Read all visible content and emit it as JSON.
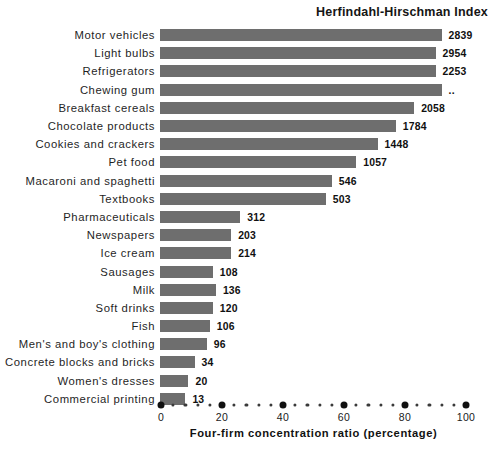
{
  "chart_data": {
    "type": "bar",
    "orientation": "horizontal",
    "title": "Herfindahl-Hirschman Index",
    "xlabel": "Four-firm concentration ratio (percentage)",
    "ylabel": "",
    "xlim": [
      0,
      100
    ],
    "xticks": [
      0,
      20,
      40,
      60,
      80,
      100
    ],
    "xtick_labels": [
      "0",
      "20",
      "40",
      "60",
      "80",
      "100"
    ],
    "minor_tick_step": 4,
    "grid": false,
    "legend": "none",
    "bar_color": "#6e6e6e",
    "value_label_header": "Herfindahl-Hirschman Index",
    "categories": [
      "Motor vehicles",
      "Light bulbs",
      "Refrigerators",
      "Chewing gum",
      "Breakfast cereals",
      "Chocolate products",
      "Cookies and crackers",
      "Pet food",
      "Macaroni and spaghetti",
      "Textbooks",
      "Pharmaceuticals",
      "Newspapers",
      "Ice cream",
      "Sausages",
      "Milk",
      "Soft drinks",
      "Fish",
      "Men's and boy's clothing",
      "Concrete blocks and bricks",
      "Women's dresses",
      "Commercial printing"
    ],
    "values": [
      92,
      90,
      90,
      92,
      83,
      77,
      71,
      64,
      56,
      54,
      26,
      23,
      23,
      17,
      18,
      17,
      16,
      15,
      11,
      9,
      8
    ],
    "value_unit": "percent",
    "hhi_labels": [
      "2839",
      "2954",
      "2253",
      "..",
      "2058",
      "1784",
      "1448",
      "1057",
      "546",
      "503",
      "312",
      "203",
      "214",
      "108",
      "136",
      "120",
      "106",
      "96",
      "34",
      "20",
      "13"
    ],
    "bars": [
      {
        "category": "Motor vehicles",
        "ratio": 92,
        "hhi": "2839"
      },
      {
        "category": "Light bulbs",
        "ratio": 90,
        "hhi": "2954"
      },
      {
        "category": "Refrigerators",
        "ratio": 90,
        "hhi": "2253"
      },
      {
        "category": "Chewing gum",
        "ratio": 92,
        "hhi": ".."
      },
      {
        "category": "Breakfast cereals",
        "ratio": 83,
        "hhi": "2058"
      },
      {
        "category": "Chocolate products",
        "ratio": 77,
        "hhi": "1784"
      },
      {
        "category": "Cookies and crackers",
        "ratio": 71,
        "hhi": "1448"
      },
      {
        "category": "Pet food",
        "ratio": 64,
        "hhi": "1057"
      },
      {
        "category": "Macaroni and spaghetti",
        "ratio": 56,
        "hhi": "546"
      },
      {
        "category": "Textbooks",
        "ratio": 54,
        "hhi": "503"
      },
      {
        "category": "Pharmaceuticals",
        "ratio": 26,
        "hhi": "312"
      },
      {
        "category": "Newspapers",
        "ratio": 23,
        "hhi": "203"
      },
      {
        "category": "Ice cream",
        "ratio": 23,
        "hhi": "214"
      },
      {
        "category": "Sausages",
        "ratio": 17,
        "hhi": "108"
      },
      {
        "category": "Milk",
        "ratio": 18,
        "hhi": "136"
      },
      {
        "category": "Soft drinks",
        "ratio": 17,
        "hhi": "120"
      },
      {
        "category": "Fish",
        "ratio": 16,
        "hhi": "106"
      },
      {
        "category": "Men's and boy's clothing",
        "ratio": 15,
        "hhi": "96"
      },
      {
        "category": "Concrete blocks and bricks",
        "ratio": 11,
        "hhi": "34"
      },
      {
        "category": "Women's dresses",
        "ratio": 9,
        "hhi": "20"
      },
      {
        "category": "Commercial printing",
        "ratio": 8,
        "hhi": "13"
      }
    ]
  }
}
